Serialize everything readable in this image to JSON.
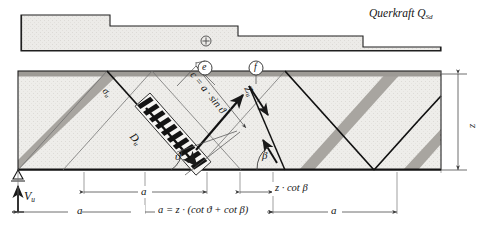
{
  "figure": {
    "colors": {
      "concrete_fill": "#ebe9e6",
      "strut_gray": "#a9a6a1",
      "outline": "#1a1a1a",
      "dim_line": "#4a4a4a",
      "top_band": "#9d9a95",
      "paper": "#ffffff"
    }
  },
  "shear_diagram": {
    "label": "Querkraft Q",
    "label_sub": "Sd",
    "sign_symbol": "+",
    "steps": [
      {
        "name": "step-1",
        "value": "high"
      },
      {
        "name": "step-2",
        "value": "medium"
      },
      {
        "name": "step-3",
        "value": "low"
      }
    ]
  },
  "truss": {
    "markers": [
      {
        "id": "e",
        "label": "e"
      },
      {
        "id": "f",
        "label": "f"
      }
    ],
    "strut_force_label": "D",
    "strut_force_sub": "u",
    "stress_label": "σ",
    "stress_sub": "u",
    "tie_force_label": "Z",
    "tie_force_sub": "u",
    "strut_width_label": "c = a · sin ϑ",
    "angle_strut": "ϑ",
    "angle_tie": "β",
    "depth_label": "z"
  },
  "dimensions": {
    "support_reaction": "V",
    "support_reaction_sub": "u",
    "spacing_a_1": "a",
    "spacing_a_2": "a",
    "spacing_a_3": "a",
    "z_cot_beta": "z · cot β",
    "formula": "a = z · (cot ϑ + cot β)"
  }
}
